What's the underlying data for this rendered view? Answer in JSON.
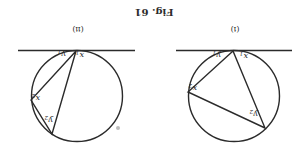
{
  "caption": "Fig. 61",
  "orientation": "rotated-180",
  "panels": [
    {
      "id": "i",
      "label": "(i)",
      "labels": {
        "x1": "x",
        "x1_sub": "1",
        "y1": "y",
        "y1_sub": "1",
        "x2": "x",
        "x2_sub": "2",
        "y2": "y",
        "y2_sub": "2"
      }
    },
    {
      "id": "ii",
      "label": "(ii)",
      "labels": {
        "x1": "x",
        "x1_sub": "1",
        "y1": "y",
        "y1_sub": "1",
        "x2": "x",
        "x2_sub": "2",
        "y2": "y",
        "y2_sub": "2"
      }
    }
  ]
}
